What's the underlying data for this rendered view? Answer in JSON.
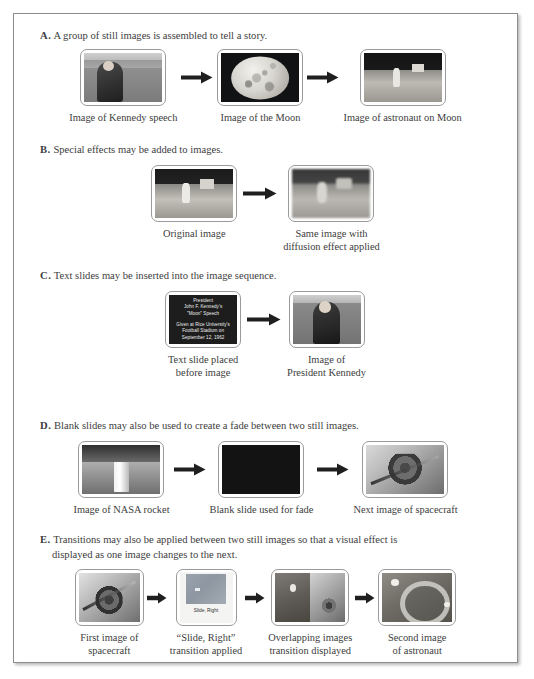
{
  "figure": {
    "sections": [
      {
        "letter": "A.",
        "heading": "A group of still images is assembled to tell a story.",
        "items": [
          {
            "caption": [
              "Image of Kennedy speech"
            ],
            "kind": "kennedy-speech"
          },
          {
            "caption": [
              "Image of the Moon"
            ],
            "kind": "moon"
          },
          {
            "caption": [
              "Image of astronaut on Moon"
            ],
            "kind": "astronaut-moon"
          }
        ]
      },
      {
        "letter": "B.",
        "heading": "Special effects may be added to images.",
        "items": [
          {
            "caption": [
              "Original image"
            ],
            "kind": "original-astronaut"
          },
          {
            "caption": [
              "Same image with",
              "diffusion effect applied"
            ],
            "kind": "diffusion-astronaut"
          }
        ]
      },
      {
        "letter": "C.",
        "heading": "Text slides may be inserted into the image sequence.",
        "items": [
          {
            "caption": [
              "Text slide placed",
              "before image"
            ],
            "kind": "text-slide",
            "slide_text_top": [
              "President",
              "John F. Kennedy's",
              "\"Moon\" Speech"
            ],
            "slide_text_bottom": [
              "Given at Rice University's",
              "Football Stadium on",
              "September 12, 1962"
            ]
          },
          {
            "caption": [
              "Image of",
              "President Kennedy"
            ],
            "kind": "kennedy-portrait"
          }
        ]
      },
      {
        "letter": "D.",
        "heading": "Blank slides may also be used to create a fade between two still images.",
        "items": [
          {
            "caption": [
              "Image of NASA rocket"
            ],
            "kind": "nasa-rocket"
          },
          {
            "caption": [
              "Blank slide used for fade"
            ],
            "kind": "blank-slide"
          },
          {
            "caption": [
              "Next image of spacecraft"
            ],
            "kind": "spacecraft"
          }
        ]
      },
      {
        "letter": "E.",
        "heading": "Transitions may also be applied between two still images so that a visual effect is",
        "heading_line2": "displayed as one image changes to the next.",
        "items": [
          {
            "caption": [
              "First image of",
              "spacecraft"
            ],
            "kind": "spacecraft-first"
          },
          {
            "caption": [
              "“Slide, Right”",
              "transition applied"
            ],
            "kind": "transition-chip",
            "chip_label": "Slide, Right"
          },
          {
            "caption": [
              "Overlapping images",
              "transition displayed"
            ],
            "kind": "overlap-split"
          },
          {
            "caption": [
              "Second image",
              "of astronaut"
            ],
            "kind": "astronaut-suit"
          }
        ]
      }
    ]
  },
  "colors": {
    "page_border": "#8d8d8d",
    "text": "#3d3d3d",
    "thumb_border": "#9a9a9a",
    "arrow": "#1f1f1f"
  }
}
